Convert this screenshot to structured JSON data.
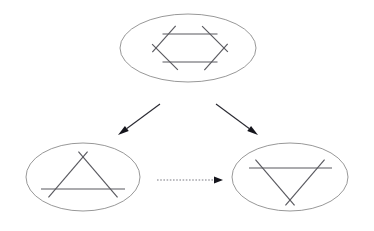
{
  "canvas": {
    "width": 374,
    "height": 231,
    "background": "#ffffff"
  },
  "colors": {
    "ellipse_stroke": "#8c8c8c",
    "shape_stroke": "#59595f",
    "arrow_stroke": "#2b2b33",
    "arrow_head": "#15151c",
    "dotted_arrow_stroke": "#7a7a82",
    "background": "#ffffff"
  },
  "nodes": [
    {
      "id": "node-hexagon",
      "name": "hexagon-node",
      "label": "",
      "shape_kind": "hexagon",
      "ellipse": {
        "cx": 188,
        "cy": 48,
        "rx": 68,
        "ry": 34
      },
      "segments": [
        {
          "x1": 168,
          "y1": 34,
          "x2": 212,
          "y2": 34
        },
        {
          "x1": 206,
          "y1": 30,
          "x2": 224,
          "y2": 48
        },
        {
          "x1": 224,
          "y1": 48,
          "x2": 208,
          "y2": 66
        },
        {
          "x1": 212,
          "y1": 62,
          "x2": 168,
          "y2": 62
        },
        {
          "x1": 174,
          "y1": 66,
          "x2": 156,
          "y2": 48
        },
        {
          "x1": 156,
          "y1": 48,
          "x2": 172,
          "y2": 30
        }
      ],
      "overshoot": 5.5,
      "segment_count": 6
    },
    {
      "id": "node-triangle-up",
      "name": "triangle-up-node",
      "label": "",
      "shape_kind": "triangle-up",
      "ellipse": {
        "cx": 83,
        "cy": 177,
        "rx": 57,
        "ry": 34
      },
      "segments": [
        {
          "x1": 48,
          "y1": 189,
          "x2": 118,
          "y2": 189
        },
        {
          "x1": 83,
          "y1": 157,
          "x2": 113,
          "y2": 192
        },
        {
          "x1": 83,
          "y1": 157,
          "x2": 53,
          "y2": 192
        }
      ],
      "overshoot": 7,
      "segment_count": 3
    },
    {
      "id": "node-triangle-down",
      "name": "triangle-down-node",
      "label": "",
      "shape_kind": "triangle-down",
      "ellipse": {
        "cx": 290,
        "cy": 177,
        "rx": 58,
        "ry": 34
      },
      "segments": [
        {
          "x1": 256,
          "y1": 168,
          "x2": 325,
          "y2": 168
        },
        {
          "x1": 290,
          "y1": 200,
          "x2": 320,
          "y2": 165
        },
        {
          "x1": 290,
          "y1": 200,
          "x2": 260,
          "y2": 165
        }
      ],
      "overshoot": 7,
      "segment_count": 3
    }
  ],
  "edges": [
    {
      "id": "edge-hex-to-up",
      "name": "arrow-hexagon-to-triangle-up",
      "style": "solid",
      "label": "",
      "from": "node-hexagon",
      "to": "node-triangle-up",
      "x1": 160,
      "y1": 104,
      "x2": 118,
      "y2": 135,
      "direction": "down-left"
    },
    {
      "id": "edge-hex-to-down",
      "name": "arrow-hexagon-to-triangle-down",
      "style": "solid",
      "label": "",
      "from": "node-hexagon",
      "to": "node-triangle-down",
      "x1": 216,
      "y1": 104,
      "x2": 258,
      "y2": 135,
      "direction": "down-right"
    },
    {
      "id": "edge-up-to-down",
      "name": "arrow-triangle-up-to-triangle-down",
      "style": "dotted",
      "label": "",
      "from": "node-triangle-up",
      "to": "node-triangle-down",
      "x1": 157,
      "y1": 180,
      "x2": 223,
      "y2": 180,
      "direction": "right"
    }
  ]
}
